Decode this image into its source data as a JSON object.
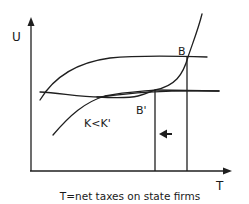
{
  "diagram": {
    "axes": {
      "y_label": "U",
      "x_label": "T"
    },
    "caption": "T=net taxes on state firms",
    "points": {
      "b": "B",
      "b_prime": "B'"
    },
    "condition_label": "K<K'",
    "arrow_direction": "left-arrow",
    "colors": {
      "line": "#1f1f1f",
      "background": "#ffffff"
    }
  }
}
